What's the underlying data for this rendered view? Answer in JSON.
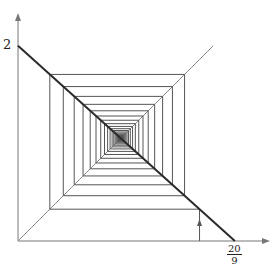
{
  "diagram": {
    "type": "cobweb",
    "function": "f(x) = 2 - 0.9x",
    "slope": -0.9,
    "intercept": 2,
    "x0": 1.86,
    "iterations": 40,
    "y_axis_label": "2",
    "x_axis_label": {
      "numerator": "20",
      "denominator": "9"
    },
    "colors": {
      "axis": "#777777",
      "function_line": "#2a2a2a",
      "diagonal": "#8a8a8a",
      "cobweb": "#555555"
    }
  }
}
